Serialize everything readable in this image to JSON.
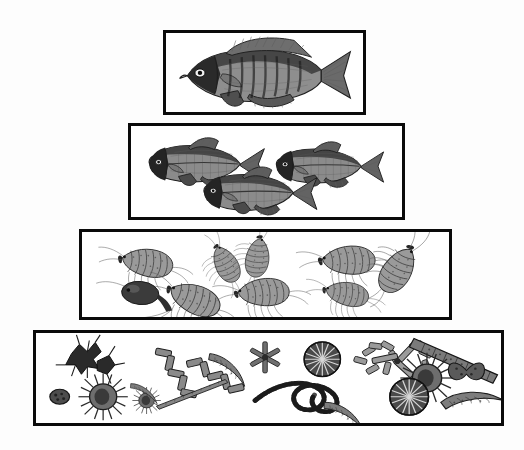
{
  "figure": {
    "type": "trophic-pyramid",
    "background_color": "#fdfdfd",
    "box_fill_color": "#ffffff",
    "box_border_color": "#0a0a0a",
    "art_style": "black-and-white stipple engraving",
    "text_labels_present": "none"
  },
  "pyramid": {
    "orientation": "apex-top",
    "tier_count": 4,
    "tiers": [
      {
        "index": 1,
        "name": "top-predator-fish",
        "level_label": "Tier 1",
        "trophic_role": "top predator",
        "organism_label": "predatory game fish (sunfish / bass)",
        "organism_count": 1,
        "box": {
          "x": 163,
          "y": 30,
          "width": 203,
          "height": 85
        }
      },
      {
        "index": 2,
        "name": "forage-fish",
        "level_label": "Tier 2",
        "trophic_role": "secondary consumer",
        "organism_label": "forage fish (minnows / shiners)",
        "organism_count": 3,
        "box": {
          "x": 128,
          "y": 123,
          "width": 277,
          "height": 97
        }
      },
      {
        "index": 3,
        "name": "zooplankton-invertebrates",
        "level_label": "Tier 3",
        "trophic_role": "primary consumer",
        "organism_label": "zooplankton and aquatic invertebrates (amphipods, scuds, copepods)",
        "organism_count": 9,
        "box": {
          "x": 79,
          "y": 229,
          "width": 373,
          "height": 91
        }
      },
      {
        "index": 4,
        "name": "phytoplankton-producers",
        "level_label": "Tier 4",
        "trophic_role": "primary producer",
        "organism_label": "phytoplankton (diatoms, desmids, filamentous algae)",
        "organism_count": 18,
        "box": {
          "x": 33,
          "y": 330,
          "width": 471,
          "height": 96
        }
      }
    ]
  },
  "organisms": {
    "tier1": [
      {
        "name": "game-fish",
        "pose": "left-facing lateral view"
      }
    ],
    "tier2": [
      {
        "name": "forage-fish-upper-left",
        "pose": "left-facing"
      },
      {
        "name": "forage-fish-upper-right",
        "pose": "left-facing"
      },
      {
        "name": "forage-fish-lower-center",
        "pose": "left-facing"
      }
    ],
    "tier3": [
      {
        "name": "amphipod-1"
      },
      {
        "name": "amphipod-2"
      },
      {
        "name": "amphipod-3"
      },
      {
        "name": "amphipod-4"
      },
      {
        "name": "amphipod-5"
      },
      {
        "name": "amphipod-6"
      },
      {
        "name": "copepod-dark"
      },
      {
        "name": "isopod"
      },
      {
        "name": "scud"
      }
    ],
    "tier4": [
      {
        "name": "star-diatom-cluster"
      },
      {
        "name": "oval-desmid"
      },
      {
        "name": "radiate-spiny-alga"
      },
      {
        "name": "small-spiny-alga"
      },
      {
        "name": "zigzag-chain-diatom"
      },
      {
        "name": "crescent-diatom-1"
      },
      {
        "name": "tabellaria-star"
      },
      {
        "name": "radial-disc-diatom-1"
      },
      {
        "name": "loose-chain-diatom"
      },
      {
        "name": "needle-diatom"
      },
      {
        "name": "filamentous-algae-tangle"
      },
      {
        "name": "y-branch-diatom"
      },
      {
        "name": "long-rod-chain-diatom"
      },
      {
        "name": "spiny-sphere-alga"
      },
      {
        "name": "butterfly-diatom"
      },
      {
        "name": "radial-disc-diatom-2"
      },
      {
        "name": "crescent-diatom-2"
      },
      {
        "name": "crescent-diatom-3"
      }
    ]
  }
}
